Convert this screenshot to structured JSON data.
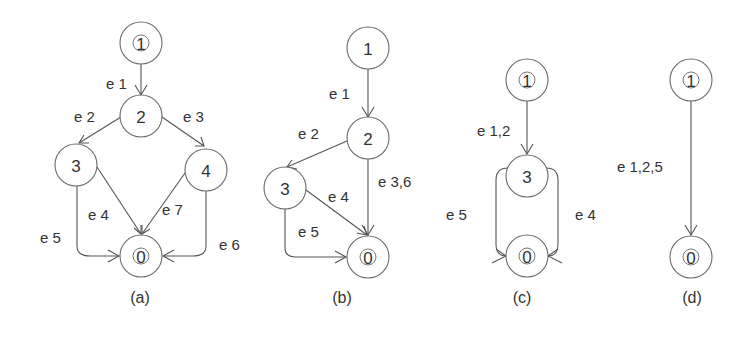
{
  "figure": {
    "colors": {
      "stroke": "#555555",
      "text": "#333333",
      "background": "#ffffff"
    },
    "panels": [
      {
        "id": "a",
        "caption": "(a)",
        "nodes": [
          {
            "id": "1",
            "label": "1",
            "double": true
          },
          {
            "id": "2",
            "label": "2",
            "double": false
          },
          {
            "id": "3",
            "label": "3",
            "double": false
          },
          {
            "id": "4",
            "label": "4",
            "double": false
          },
          {
            "id": "0",
            "label": "0",
            "double": true
          }
        ],
        "edges": [
          {
            "from": "1",
            "to": "2",
            "label": "e 1"
          },
          {
            "from": "2",
            "to": "3",
            "label": "e 2"
          },
          {
            "from": "2",
            "to": "4",
            "label": "e 3"
          },
          {
            "from": "3",
            "to": "0",
            "label": "e 4"
          },
          {
            "from": "3",
            "to": "0",
            "label": "e 5"
          },
          {
            "from": "4",
            "to": "0",
            "label": "e 6"
          },
          {
            "from": "4",
            "to": "0",
            "label": "e 7"
          }
        ]
      },
      {
        "id": "b",
        "caption": "(b)",
        "nodes": [
          {
            "id": "1",
            "label": "1",
            "double": false
          },
          {
            "id": "2",
            "label": "2",
            "double": false
          },
          {
            "id": "3",
            "label": "3",
            "double": false
          },
          {
            "id": "0",
            "label": "0",
            "double": true
          }
        ],
        "edges": [
          {
            "from": "1",
            "to": "2",
            "label": "e 1"
          },
          {
            "from": "2",
            "to": "3",
            "label": "e 2"
          },
          {
            "from": "2",
            "to": "0",
            "label": "e 3,6"
          },
          {
            "from": "3",
            "to": "0",
            "label": "e 4"
          },
          {
            "from": "3",
            "to": "0",
            "label": "e 5"
          }
        ]
      },
      {
        "id": "c",
        "caption": "(c)",
        "nodes": [
          {
            "id": "1",
            "label": "1",
            "double": true
          },
          {
            "id": "3",
            "label": "3",
            "double": false
          },
          {
            "id": "0",
            "label": "0",
            "double": true
          }
        ],
        "edges": [
          {
            "from": "1",
            "to": "3",
            "label": "e 1,2"
          },
          {
            "from": "3",
            "to": "0",
            "label": "e 5"
          },
          {
            "from": "3",
            "to": "0",
            "label": "e 4"
          }
        ]
      },
      {
        "id": "d",
        "caption": "(d)",
        "nodes": [
          {
            "id": "1",
            "label": "1",
            "double": true
          },
          {
            "id": "0",
            "label": "0",
            "double": true
          }
        ],
        "edges": [
          {
            "from": "1",
            "to": "0",
            "label": "e 1,2,5"
          }
        ]
      }
    ]
  }
}
